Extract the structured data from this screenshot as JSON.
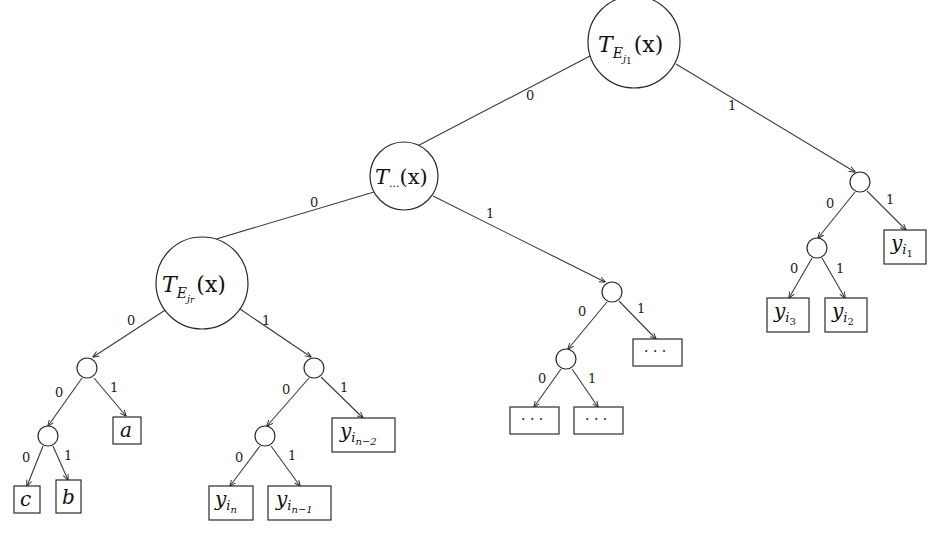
{
  "diagram": {
    "type": "binary-decision-tree",
    "edge_labels": {
      "left": "0",
      "right": "1"
    },
    "nodes": {
      "root": {
        "label_main": "T",
        "label_sub": "E",
        "label_subsub": "j1",
        "label_subsub_i": "j",
        "label_subsub_n": "1",
        "label_arg": "(x)"
      },
      "mid": {
        "label_main": "T",
        "label_sub": "...",
        "label_arg": "(x)"
      },
      "low": {
        "label_main": "T",
        "label_sub": "E",
        "label_subsub_i": "j",
        "label_subsub_n": "r",
        "label_arg": "(x)"
      }
    },
    "leaves": {
      "c": "c",
      "b": "b",
      "a": "a",
      "y_in": {
        "main": "y",
        "sub": "i",
        "subsub": "n"
      },
      "y_in1": {
        "main": "y",
        "sub": "i",
        "subsub": "n−1"
      },
      "y_in2": {
        "main": "y",
        "sub": "i",
        "subsub": "n−2"
      },
      "dots1": "· · ·",
      "dots2": "· · ·",
      "dots3": "· · ·",
      "y_i3": {
        "main": "y",
        "sub": "i",
        "subsub": "3"
      },
      "y_i2": {
        "main": "y",
        "sub": "i",
        "subsub": "2"
      },
      "y_i1": {
        "main": "y",
        "sub": "i",
        "subsub": "1"
      }
    }
  }
}
